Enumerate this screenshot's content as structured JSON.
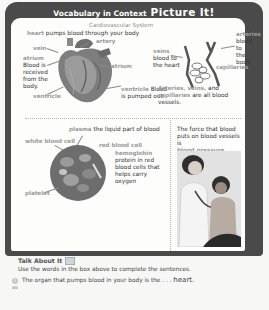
{
  "banner": {
    "small_title": "Vocabulary in Context",
    "big_title": "Picture It!",
    "background": "#4a4a4a"
  },
  "heart_section": {
    "subtitle": "Cardiovascular System",
    "heart_term": "heart",
    "heart_def": "pumps blood through your body",
    "labels": {
      "artery": "artery",
      "vein": "vein",
      "atrium_right": "atrium",
      "atrium_left": "atrium",
      "ventricle_right": "ventricle",
      "ventricle_left": "ventricle"
    },
    "atrium_def": [
      "Blood is",
      "received",
      "from the",
      "body."
    ],
    "ventricle_def": [
      "Blood",
      "is pumped out."
    ]
  },
  "vessels_section": {
    "arteries_term": "arteries",
    "arteries_def": [
      "blood to",
      "the body"
    ],
    "veins_term": "veins",
    "veins_def": [
      "blood to",
      "the heart"
    ],
    "capillaries_label": "capillaries",
    "summary_terms": [
      "Arteries",
      "veins",
      "capillaries"
    ],
    "summary_line1_a": "Arteries, veins,",
    "summary_line1_b": "and",
    "summary_line2_a": "capillaries",
    "summary_line2_b": "are all blood",
    "summary_line3": "vessels."
  },
  "blood_section": {
    "plasma_term": "plasma",
    "plasma_def": "the liquid part of blood",
    "white_blood_cell": "white blood cell",
    "red_blood_cell": "red blood cell",
    "platelet": "platelet",
    "hemoglobin_term": "hemoglobin",
    "hemoglobin_def": [
      "protein in red",
      "blood cells that",
      "helps carry",
      "oxygen"
    ]
  },
  "pressure_section": {
    "line1": "The force that blood",
    "line2": "puts on blood vessels is",
    "term": "blood pressure."
  },
  "talk_about_it": {
    "title": "Talk About It",
    "instructions": "Use the words in the box above to complete the sentences.",
    "questions": [
      {
        "number": "1",
        "text": "The organ that pumps blood in your body is the . . .",
        "answer": "heart."
      }
    ]
  }
}
